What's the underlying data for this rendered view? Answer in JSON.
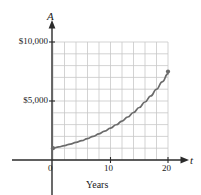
{
  "figure": {
    "background_color": "#ffffff",
    "curve_color": "#6b6b6b",
    "grid_color": "#c8c8c8",
    "axis_color": "#2b2b2b",
    "text_color": "#1a1a1a"
  },
  "axes": {
    "y_axis_label": "A",
    "x_axis_label": "t",
    "x_caption": "Years",
    "y_ticks": [
      {
        "label": "$10,000",
        "value": 10000
      },
      {
        "label": "$5,000",
        "value": 5000
      }
    ],
    "x_ticks": [
      {
        "label": "0",
        "value": 0
      },
      {
        "label": "10",
        "value": 10
      },
      {
        "label": "20",
        "value": 20
      }
    ]
  },
  "chart_data": {
    "type": "line",
    "title": "",
    "subtitle": "",
    "xlabel": "t",
    "ylabel": "A",
    "x_caption": "Years",
    "xlim": [
      0,
      20
    ],
    "ylim": [
      0,
      10000
    ],
    "grid": true,
    "grid_columns": 10,
    "grid_rows": 10,
    "grid_x_step": 2,
    "grid_y_step": 1000,
    "legend": null,
    "legend_position": "none",
    "xtick_labels": [
      "0",
      "10",
      "20"
    ],
    "xtick_values": [
      0,
      10,
      20
    ],
    "ytick_labels": [
      "$5,000",
      "$10,000"
    ],
    "ytick_values": [
      5000,
      10000
    ],
    "series": [
      {
        "name": "A",
        "marker_points": [
          {
            "x": 0,
            "y": 1000
          },
          {
            "x": 20,
            "y": 7500
          }
        ],
        "x": [
          0,
          1,
          2,
          3,
          4,
          5,
          6,
          7,
          8,
          9,
          10,
          11,
          12,
          13,
          14,
          15,
          16,
          17,
          18,
          19,
          20
        ],
        "values": [
          1000,
          1105,
          1220,
          1348,
          1489,
          1645,
          1817,
          2007,
          2217,
          2449,
          2705,
          2988,
          3301,
          3646,
          4027,
          4449,
          4914,
          5428,
          5996,
          6623,
          7315
        ]
      }
    ],
    "annotations": []
  }
}
